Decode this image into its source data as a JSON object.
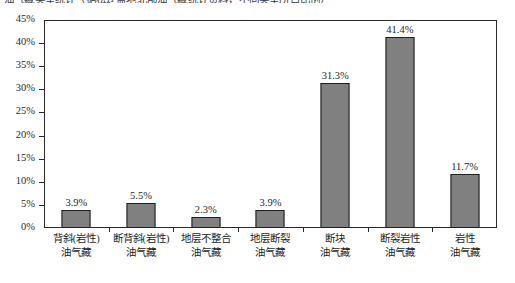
{
  "top_clipped_text": "油气藏类型统计（据松辽盆地北部油气藏统计资料，不同类型所占比例）",
  "chart_data": {
    "type": "bar",
    "title": "",
    "subtitle": "",
    "xlabel": "",
    "ylabel": "",
    "ylim": [
      0,
      45
    ],
    "ytick_values": [
      45,
      40,
      35,
      30,
      25,
      20,
      15,
      10,
      5,
      0
    ],
    "ytick_labels": [
      "45%",
      "40%",
      "35%",
      "30%",
      "25%",
      "20%",
      "15%",
      "10%",
      "5%",
      "0%"
    ],
    "grid": false,
    "legend": false,
    "legend_position": "none",
    "bar_color": "#808080",
    "bar_border_color": "#1f1f1f",
    "categories": [
      {
        "line1": "背斜(岩性)",
        "line2": "油气藏"
      },
      {
        "line1": "断背斜(岩性)",
        "line2": "油气藏"
      },
      {
        "line1": "地层不整合",
        "line2": "油气藏"
      },
      {
        "line1": "地层断裂",
        "line2": "油气藏"
      },
      {
        "line1": "断块",
        "line2": "油气藏"
      },
      {
        "line1": "断裂岩性",
        "line2": "油气藏"
      },
      {
        "line1": "岩性",
        "line2": "油气藏"
      }
    ],
    "values": [
      3.9,
      5.5,
      2.3,
      3.9,
      31.3,
      41.4,
      11.7
    ],
    "value_labels": [
      "3.9%",
      "5.5%",
      "2.3%",
      "3.9%",
      "31.3%",
      "41.4%",
      "11.7%"
    ]
  }
}
